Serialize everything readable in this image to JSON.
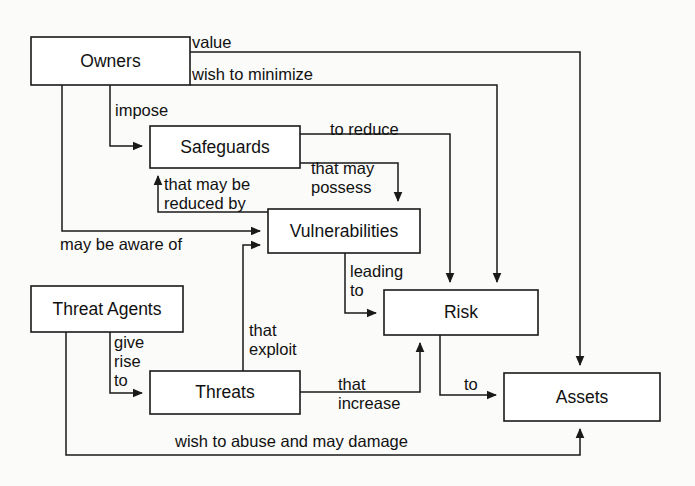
{
  "diagram": {
    "type": "node-link-diagram",
    "stroke_color": "#1a1a1a",
    "background_color": "#fbfbf9",
    "node_fill": "#ffffff",
    "nodes": [
      {
        "id": "owners",
        "label": "Owners",
        "x": 31,
        "y": 37,
        "w": 159,
        "h": 48
      },
      {
        "id": "safeguards",
        "label": "Safeguards",
        "x": 150,
        "y": 126,
        "w": 150,
        "h": 42
      },
      {
        "id": "vulnerabilities",
        "label": "Vulnerabilities",
        "x": 268,
        "y": 209,
        "w": 152,
        "h": 44
      },
      {
        "id": "threat_agents",
        "label": "Threat Agents",
        "x": 31,
        "y": 286,
        "w": 152,
        "h": 46
      },
      {
        "id": "risk",
        "label": "Risk",
        "x": 384,
        "y": 290,
        "w": 154,
        "h": 45
      },
      {
        "id": "threats",
        "label": "Threats",
        "x": 150,
        "y": 371,
        "w": 150,
        "h": 43
      },
      {
        "id": "assets",
        "label": "Assets",
        "x": 504,
        "y": 373,
        "w": 156,
        "h": 48
      }
    ],
    "edges": [
      {
        "id": "owners-value-assets",
        "from": "owners",
        "to": "assets",
        "label": "value",
        "label_x": 192,
        "label_y": 42
      },
      {
        "id": "owners-minimize-risk",
        "from": "owners",
        "to": "risk",
        "label": "wish to minimize",
        "label_x": 192,
        "label_y": 74
      },
      {
        "id": "owners-impose-safeguards",
        "from": "owners",
        "to": "safeguards",
        "label": "impose",
        "label_x": 115,
        "label_y": 110
      },
      {
        "id": "owners-aware-vulnerabilities",
        "from": "owners",
        "to": "vulnerabilities",
        "label": "may be aware of",
        "label_x": 60,
        "label_y": 244
      },
      {
        "id": "safeguards-reduce-risk",
        "from": "safeguards",
        "to": "risk",
        "label": "to reduce",
        "label_x": 352,
        "label_y": 129
      },
      {
        "id": "safeguards-possess-vuln",
        "from": "safeguards",
        "to": "vulnerabilities",
        "label": "that may possess",
        "label_x": 318,
        "label_y": 176
      },
      {
        "id": "vuln-reduced-safeguards",
        "from": "vulnerabilities",
        "to": "safeguards",
        "label": "that may be reduced by",
        "label_x": 168,
        "label_y": 186
      },
      {
        "id": "vuln-leading-risk",
        "from": "vulnerabilities",
        "to": "risk",
        "label": "leading to",
        "label_x": 349,
        "label_y": 271
      },
      {
        "id": "agents-giverise-threats",
        "from": "threat_agents",
        "to": "threats",
        "label": "give rise to",
        "label_x": 111,
        "label_y": 339
      },
      {
        "id": "agents-abuse-assets",
        "from": "threat_agents",
        "to": "assets",
        "label": "wish to abuse and may damage",
        "label_x": 175,
        "label_y": 440
      },
      {
        "id": "threats-exploit-vuln",
        "from": "threats",
        "to": "vulnerabilities",
        "label": "that exploit",
        "label_x": 248,
        "label_y": 330
      },
      {
        "id": "threats-increase-risk",
        "from": "threats",
        "to": "risk",
        "label": "that increase",
        "label_x": 338,
        "label_y": 386
      },
      {
        "id": "risk-to-assets",
        "from": "risk",
        "to": "assets",
        "label": "to",
        "label_x": 465,
        "label_y": 384
      }
    ],
    "edge_label_lines": {
      "owners-value-assets": [
        "value"
      ],
      "owners-minimize-risk": [
        "wish to minimize"
      ],
      "owners-impose-safeguards": [
        "impose"
      ],
      "owners-aware-vulnerabilities": [
        "may be aware of"
      ],
      "safeguards-reduce-risk": [
        "to reduce"
      ],
      "safeguards-possess-vuln": [
        "that may",
        "possess"
      ],
      "vuln-reduced-safeguards": [
        "that may be",
        "reduced by"
      ],
      "vuln-leading-risk": [
        "leading",
        "to"
      ],
      "agents-giverise-threats": [
        "give",
        "rise",
        "to"
      ],
      "agents-abuse-assets": [
        "wish to abuse and may damage"
      ],
      "threats-exploit-vuln": [
        "that",
        "exploit"
      ],
      "threats-increase-risk": [
        "that",
        "increase"
      ],
      "risk-to-assets": [
        "to"
      ]
    }
  }
}
